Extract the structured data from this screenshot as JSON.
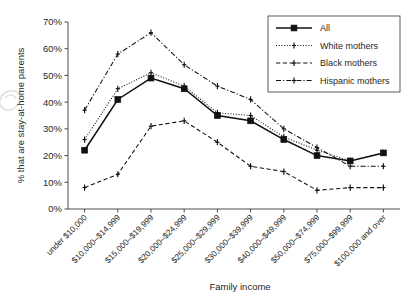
{
  "chart_data": {
    "type": "line",
    "title": "",
    "xlabel": "Family income",
    "ylabel": "% that are stay-at-home parents",
    "ylim": [
      0,
      70
    ],
    "yticks": [
      0,
      10,
      20,
      30,
      40,
      50,
      60,
      70
    ],
    "ytick_labels": [
      "0%",
      "10%",
      "20%",
      "30%",
      "40%",
      "50%",
      "60%",
      "70%"
    ],
    "grid": false,
    "legend_position": "top-right",
    "categories": [
      "under $10,000",
      "$10,000–$14,999",
      "$15,000–$19,999",
      "$20,000–$24,999",
      "$25,000–$29,999",
      "$30,000–$39,999",
      "$40,000–$49,999",
      "$50,000–$74,999",
      "$75,000–$99,999",
      "$100,000 and over"
    ],
    "series": [
      {
        "name": "All",
        "line_style": "solid",
        "marker": "square",
        "values": [
          22,
          41,
          49,
          45,
          35,
          33,
          26,
          20,
          18,
          21
        ]
      },
      {
        "name": "White mothers",
        "line_style": "dotted",
        "marker": "plus",
        "values": [
          26,
          45,
          51,
          46,
          36,
          35,
          27,
          22,
          18,
          21
        ]
      },
      {
        "name": "Black mothers",
        "line_style": "dashed",
        "marker": "plus",
        "values": [
          8,
          13,
          31,
          33,
          25,
          16,
          14,
          7,
          8,
          8
        ]
      },
      {
        "name": "Hispanic mothers",
        "line_style": "dash-dot",
        "marker": "plus",
        "values": [
          37,
          58,
          66,
          54,
          46,
          41,
          30,
          23,
          16,
          16
        ]
      }
    ]
  },
  "legend": {
    "entries": [
      {
        "label": "All"
      },
      {
        "label": "White mothers"
      },
      {
        "label": "Black mothers"
      },
      {
        "label": "Hispanic mothers"
      }
    ]
  },
  "colors": {
    "line": "#111111",
    "axis": "#3b3b3b",
    "background": "#ffffff"
  },
  "watermark": {
    "icon": "watermark-glyph"
  }
}
